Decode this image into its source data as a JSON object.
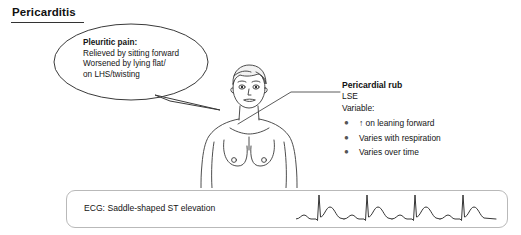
{
  "title": "Pericarditis",
  "bubble": {
    "heading": "Pleuritic pain:",
    "line1": "Relieved by sitting forward",
    "line2": "Worsened by lying flat/",
    "line3": "on LHS/twisting"
  },
  "figure": {
    "name": "female-torso-line-drawing"
  },
  "rub": {
    "title": "Pericardial rub",
    "location": "LSE",
    "variable_label": "Variable:",
    "bullet_glyph": "●",
    "items": [
      "↑ on leaning forward",
      "Varies with respiration",
      "Varies over time"
    ]
  },
  "ecg": {
    "label": "ECG: Saddle-shaped ST elevation",
    "beats": 4
  },
  "colors": {
    "ink": "#141414",
    "line": "#333333",
    "box_border": "#b9b9b9",
    "background": "#ffffff"
  }
}
